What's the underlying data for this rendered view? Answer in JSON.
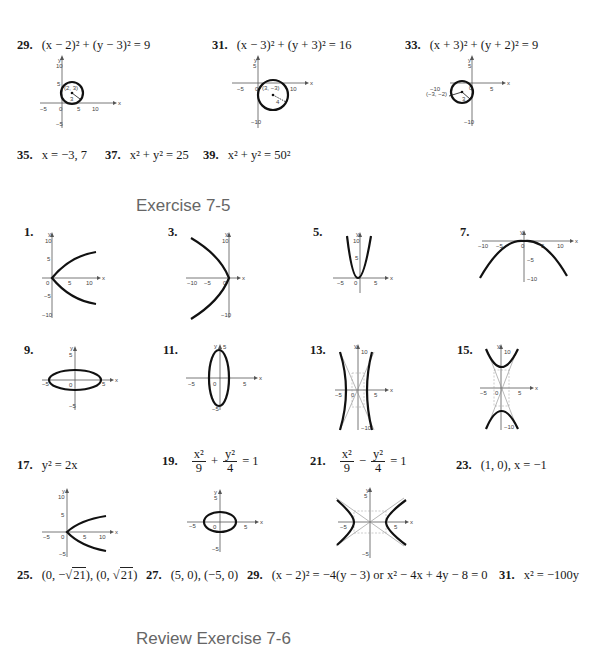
{
  "section1": {
    "answers": [
      {
        "num": "29.",
        "text": "(x − 2)² + (y − 3)² = 9"
      },
      {
        "num": "31.",
        "text": "(x − 3)² + (y + 3)² = 16"
      },
      {
        "num": "33.",
        "text": "(x + 3)² + (y + 2)² = 9"
      }
    ],
    "graph_labels": {
      "g29": {
        "center": "(2, 3)",
        "radius": "3"
      },
      "g31": {
        "center": "(3, −3)",
        "radius": "4"
      },
      "g33": {
        "center": "(−3, −2)",
        "radius": "3"
      }
    },
    "inline_answers": [
      {
        "num": "35.",
        "text": "x = −3, 7"
      },
      {
        "num": "37.",
        "text": "x² + y² = 25"
      },
      {
        "num": "39.",
        "text": "x² + y² = 50²"
      }
    ]
  },
  "exercise_7_5": {
    "title": "Exercise 7-5",
    "graphs": [
      {
        "num": "1."
      },
      {
        "num": "3."
      },
      {
        "num": "5."
      },
      {
        "num": "7."
      },
      {
        "num": "9."
      },
      {
        "num": "11."
      },
      {
        "num": "13."
      },
      {
        "num": "15."
      }
    ],
    "answers_row": [
      {
        "num": "17.",
        "text": "y² = 2x"
      },
      {
        "num": "19.",
        "n1": "x²",
        "d1": "9",
        "op": "+",
        "n2": "y²",
        "d2": "4",
        "rhs": "= 1"
      },
      {
        "num": "21.",
        "n1": "x²",
        "d1": "9",
        "op": "−",
        "n2": "y²",
        "d2": "4",
        "rhs": "= 1"
      },
      {
        "num": "23.",
        "text": "(1, 0), x = −1"
      }
    ],
    "final_row": [
      {
        "num": "25.",
        "pre": "(0, −",
        "rad1": "21",
        "mid": "), (0, ",
        "rad2": "21",
        "post": ")"
      },
      {
        "num": "27.",
        "text": "(5, 0), (−5, 0)"
      },
      {
        "num": "29.",
        "text": "(x − 2)² = −4(y − 3) or x² − 4x + 4y − 8 = 0"
      },
      {
        "num": "31.",
        "text": "x² = −100y"
      }
    ]
  },
  "review": {
    "title": "Review Exercise 7-6"
  },
  "axis_labels": {
    "x": "x",
    "y": "y",
    "zero": "0",
    "five": "5",
    "ten": "10",
    "neg_five": "−5",
    "neg_ten": "−10"
  }
}
